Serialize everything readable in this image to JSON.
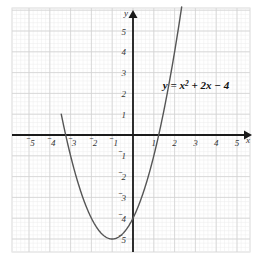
{
  "figure": {
    "name": "coordinate-plane-parabola",
    "background_color": "#ffffff",
    "grid_border_color": "#d9d9d9",
    "minor_grid_color": "#ececec",
    "major_grid_color": "#d2d2d2",
    "axis_color": "#1a1a1a",
    "curve_color": "#555555"
  },
  "labels": {
    "x_axis_name": "x",
    "y_axis_name": "y",
    "equation_parts": {
      "lead": "y = x",
      "exponent": "2",
      "tail": " + 2x − 4"
    },
    "equation_text": "y = x² + 2x − 4",
    "minus_sign": "⁻"
  },
  "x_ticks": [
    {
      "value": -5,
      "label": "5",
      "negative": true
    },
    {
      "value": -4,
      "label": "4",
      "negative": true
    },
    {
      "value": -3,
      "label": "3",
      "negative": true
    },
    {
      "value": -2,
      "label": "2",
      "negative": true
    },
    {
      "value": -1,
      "label": "1",
      "negative": true
    },
    {
      "value": 1,
      "label": "1",
      "negative": false
    },
    {
      "value": 2,
      "label": "2",
      "negative": false
    },
    {
      "value": 3,
      "label": "3",
      "negative": false
    },
    {
      "value": 4,
      "label": "4",
      "negative": false
    },
    {
      "value": 5,
      "label": "5",
      "negative": false
    }
  ],
  "y_ticks": [
    {
      "value": 5,
      "label": "5",
      "negative": false
    },
    {
      "value": 4,
      "label": "4",
      "negative": false
    },
    {
      "value": 3,
      "label": "3",
      "negative": false
    },
    {
      "value": 2,
      "label": "2",
      "negative": false
    },
    {
      "value": 1,
      "label": "1",
      "negative": false
    },
    {
      "value": -1,
      "label": "1",
      "negative": true
    },
    {
      "value": -2,
      "label": "2",
      "negative": true
    },
    {
      "value": -3,
      "label": "3",
      "negative": true
    },
    {
      "value": -4,
      "label": "4",
      "negative": true
    },
    {
      "value": -5,
      "label": "5",
      "negative": true
    }
  ],
  "chart_data": {
    "type": "line",
    "title": "",
    "subtitle": "",
    "xlabel": "x",
    "ylabel": "y",
    "xlim": [
      -5.7,
      5.6
    ],
    "ylim": [
      -5.8,
      6.2
    ],
    "grid": true,
    "minor_grid_divisions": 5,
    "legend_position": "inline-annotation",
    "annotations": [
      {
        "text": "y = x² + 2x − 4",
        "x": 2.6,
        "y": 2.2
      }
    ],
    "series": [
      {
        "name": "y = x² + 2x − 4",
        "equation": "y = x^2 + 2x - 4",
        "color": "#555555",
        "vertex": [
          -1,
          -5
        ],
        "roots": [
          -3.236,
          1.236
        ],
        "y_intercept": -4,
        "x": [
          -3.3,
          -3.2,
          -3.0,
          -2.8,
          -2.6,
          -2.4,
          -2.2,
          -2.0,
          -1.8,
          -1.6,
          -1.4,
          -1.2,
          -1.0,
          -0.8,
          -0.6,
          -0.4,
          -0.2,
          0.0,
          0.2,
          0.4,
          0.6,
          0.8,
          1.0,
          1.2,
          1.4,
          1.6,
          1.8,
          2.0,
          2.2,
          2.4
        ],
        "y": [
          0.29,
          -0.16,
          -1.0,
          -1.76,
          -2.44,
          -3.04,
          -3.56,
          -4.0,
          -4.36,
          -4.64,
          -4.84,
          -4.96,
          -5.0,
          -4.96,
          -4.84,
          -4.64,
          -4.36,
          -4.0,
          -3.56,
          -3.04,
          -2.44,
          -1.76,
          -1.0,
          -0.16,
          0.76,
          1.76,
          2.84,
          4.0,
          5.24,
          6.56
        ]
      }
    ]
  }
}
